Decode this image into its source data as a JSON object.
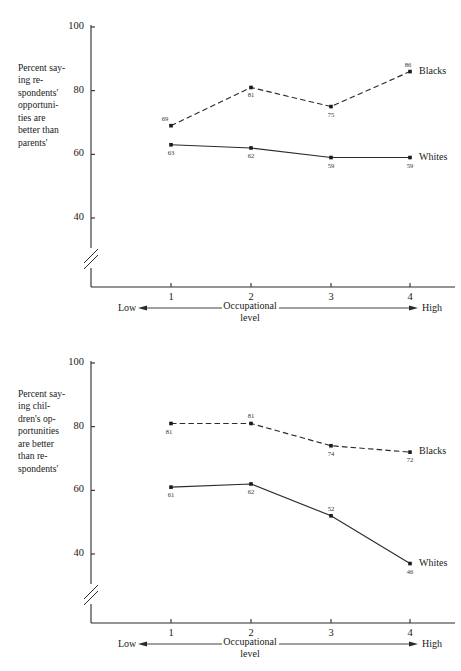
{
  "chart_data": [
    {
      "id": "top",
      "type": "line",
      "title": "",
      "ylabel": "Percent say-\ning re-\nspondents'\nopportuni-\nties are\nbetter than\nparents'",
      "ylabel_plain": "Percent saying respondents' opportunities are better than parents'",
      "xlabel": "Occupational\nlevel",
      "xlabel_plain": "Occupational level",
      "x_low_label": "Low",
      "x_high_label": "High",
      "categories": [
        "1",
        "2",
        "3",
        "4"
      ],
      "x": [
        1,
        2,
        3,
        4
      ],
      "ylim": [
        40,
        100
      ],
      "yticks": [
        "100",
        "80",
        "60",
        "40"
      ],
      "ytick_values": [
        100,
        80,
        60,
        40
      ],
      "axis_break": true,
      "grid": false,
      "legend_position": "right-end-of-line",
      "series": [
        {
          "name": "Blacks",
          "style": "dashed",
          "values": [
            69,
            81,
            75,
            86
          ],
          "labels": [
            "69",
            "81",
            "75",
            "86"
          ]
        },
        {
          "name": "Whites",
          "style": "solid",
          "values": [
            63,
            62,
            59,
            59
          ],
          "labels": [
            "63",
            "62",
            "59",
            "59"
          ]
        }
      ]
    },
    {
      "id": "bottom",
      "type": "line",
      "title": "",
      "ylabel": "Percent say-\ning chil-\ndren's op-\nportunities\nare better\nthan re-\nspondents'",
      "ylabel_plain": "Percent saying children's opportunities are better than respondents'",
      "xlabel": "Occupational\nlevel",
      "xlabel_plain": "Occupational level",
      "x_low_label": "Low",
      "x_high_label": "High",
      "categories": [
        "1",
        "2",
        "3",
        "4"
      ],
      "x": [
        1,
        2,
        3,
        4
      ],
      "ylim": [
        40,
        100
      ],
      "yticks": [
        "100",
        "80",
        "60",
        "40"
      ],
      "ytick_values": [
        100,
        80,
        60,
        40
      ],
      "axis_break": true,
      "grid": false,
      "legend_position": "right-end-of-line",
      "series": [
        {
          "name": "Blacks",
          "style": "dashed",
          "values": [
            81,
            81,
            74,
            72
          ],
          "labels": [
            "81",
            "81",
            "74",
            "72"
          ]
        },
        {
          "name": "Whites",
          "style": "solid",
          "values": [
            61,
            62,
            52,
            37
          ],
          "labels": [
            "61",
            "62",
            "52",
            "46"
          ]
        }
      ]
    }
  ],
  "colors": {
    "ink": "#1a1a1a",
    "line": "#2b2b2b",
    "background": "#ffffff"
  }
}
